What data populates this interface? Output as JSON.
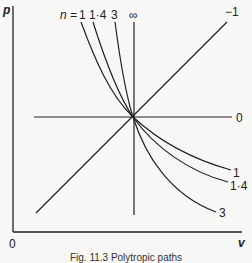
{
  "diagram": {
    "axes": {
      "y_label": "p",
      "x_label": "v",
      "origin_label": "0"
    },
    "top_labels": {
      "n_prefix": "n =",
      "n1": "1",
      "n14": "1·4",
      "n3": "3",
      "ninf": "∞"
    },
    "right_labels": {
      "neg1": "−1",
      "zero": "0",
      "one": "1",
      "one_four": "1·4",
      "three": "3"
    },
    "paths": [
      {
        "n": "-1",
        "type": "line"
      },
      {
        "n": "0",
        "type": "horizontal line"
      },
      {
        "n": "1",
        "type": "curve"
      },
      {
        "n": "1·4",
        "type": "curve"
      },
      {
        "n": "3",
        "type": "curve"
      },
      {
        "n": "∞",
        "type": "vertical line"
      }
    ],
    "caption": "Fig. 11.3 Polytropic paths"
  },
  "colors": {
    "ink": "#222222",
    "background": "#f7f7f5"
  }
}
